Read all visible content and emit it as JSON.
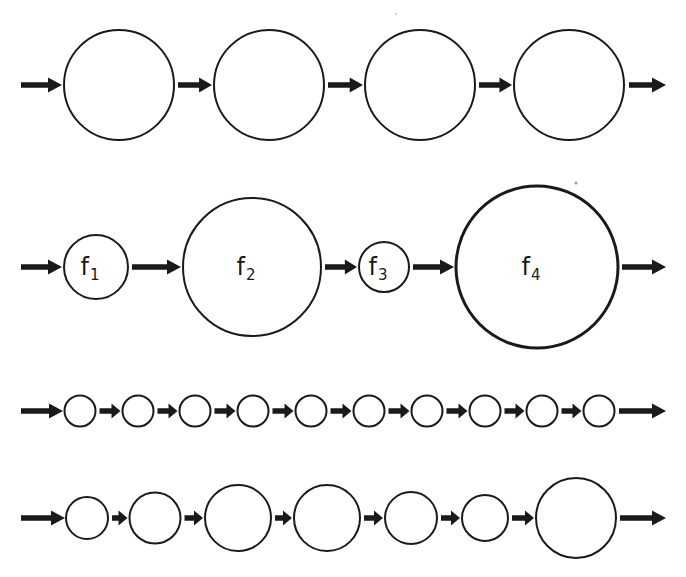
{
  "figure": {
    "colors": {
      "stroke": "#1a1a1a",
      "background": "#ffffff",
      "speck": "#9a9a9a"
    },
    "rows": [
      {
        "id": "row-1-equal-large",
        "cy": 85,
        "stroke_width": 2,
        "entry_arrow": {
          "x1": 21,
          "x2": 62
        },
        "exit_arrow": {
          "x1": 629,
          "x2": 666
        },
        "nodes": [
          {
            "cx": 119,
            "r": 55,
            "label": "",
            "sub": ""
          },
          {
            "cx": 269,
            "r": 55,
            "label": "",
            "sub": ""
          },
          {
            "cx": 420,
            "r": 55,
            "label": "",
            "sub": ""
          },
          {
            "cx": 569,
            "r": 55,
            "label": "",
            "sub": ""
          }
        ]
      },
      {
        "id": "row-2-labeled-varying",
        "cy": 267,
        "stroke_width": 2,
        "entry_arrow": {
          "x1": 21,
          "x2": 62
        },
        "exit_arrow": {
          "x1": 622,
          "x2": 666
        },
        "nodes": [
          {
            "cx": 96,
            "r": 32,
            "label": "f",
            "sub": "1"
          },
          {
            "cx": 252,
            "r": 69,
            "label": "f",
            "sub": "2"
          },
          {
            "cx": 384,
            "r": 25,
            "label": "f",
            "sub": "3"
          },
          {
            "cx": 537,
            "r": 81,
            "label": "f",
            "sub": "4",
            "stroke_width": 3
          }
        ]
      },
      {
        "id": "row-3-many-small",
        "cy": 411,
        "stroke_width": 2,
        "entry_arrow": {
          "x1": 21,
          "x2": 63
        },
        "exit_arrow": {
          "x1": 619,
          "x2": 666
        },
        "nodes": [
          {
            "cx": 80,
            "r": 15.5,
            "label": "",
            "sub": ""
          },
          {
            "cx": 138,
            "r": 15.5,
            "label": "",
            "sub": ""
          },
          {
            "cx": 195,
            "r": 15.5,
            "label": "",
            "sub": ""
          },
          {
            "cx": 253,
            "r": 15.5,
            "label": "",
            "sub": ""
          },
          {
            "cx": 311,
            "r": 15.5,
            "label": "",
            "sub": ""
          },
          {
            "cx": 369,
            "r": 15.5,
            "label": "",
            "sub": ""
          },
          {
            "cx": 427,
            "r": 15.5,
            "label": "",
            "sub": ""
          },
          {
            "cx": 485,
            "r": 15.5,
            "label": "",
            "sub": ""
          },
          {
            "cx": 542,
            "r": 15.5,
            "label": "",
            "sub": ""
          },
          {
            "cx": 599,
            "r": 15.5,
            "label": "",
            "sub": ""
          }
        ]
      },
      {
        "id": "row-4-mixed-sizes",
        "cy": 518,
        "stroke_width": 2,
        "entry_arrow": {
          "x1": 21,
          "x2": 65
        },
        "exit_arrow": {
          "x1": 620,
          "x2": 666
        },
        "nodes": [
          {
            "cx": 87,
            "r": 21,
            "label": "",
            "sub": ""
          },
          {
            "cx": 155,
            "r": 25.5,
            "label": "",
            "sub": ""
          },
          {
            "cx": 238,
            "r": 33,
            "label": "",
            "sub": ""
          },
          {
            "cx": 327,
            "r": 33,
            "label": "",
            "sub": ""
          },
          {
            "cx": 411,
            "r": 26,
            "label": "",
            "sub": ""
          },
          {
            "cx": 485,
            "r": 23,
            "label": "",
            "sub": ""
          },
          {
            "cx": 576,
            "r": 40,
            "label": "",
            "sub": ""
          }
        ]
      }
    ],
    "specks": [
      {
        "cx": 576,
        "cy": 183,
        "r": 1.5
      },
      {
        "cx": 396,
        "cy": 14,
        "r": 0.8
      }
    ]
  }
}
